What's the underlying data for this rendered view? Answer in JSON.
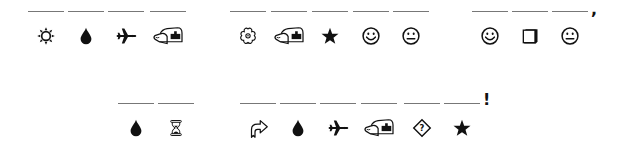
{
  "puzzle": {
    "row1": {
      "groups": [
        {
          "slots": [
            {
              "icon": "sun-icon",
              "glyph": "☼"
            },
            {
              "icon": "droplet-icon",
              "glyph": "💧"
            },
            {
              "icon": "airplane-icon",
              "glyph": "✈"
            },
            {
              "icon": "mailbox-icon",
              "glyph": "📫"
            }
          ],
          "trailing": ""
        },
        {
          "slots": [
            {
              "icon": "flower-icon",
              "glyph": "✿"
            },
            {
              "icon": "mailbox-icon",
              "glyph": "📫"
            },
            {
              "icon": "star-icon",
              "glyph": "★"
            },
            {
              "icon": "smiley-icon",
              "glyph": "☺"
            },
            {
              "icon": "neutral-face-icon",
              "glyph": "😐"
            }
          ],
          "trailing": ""
        },
        {
          "slots": [
            {
              "icon": "smiley-icon",
              "glyph": "☺"
            },
            {
              "icon": "shadowed-square-icon",
              "glyph": "❒"
            },
            {
              "icon": "neutral-face-icon",
              "glyph": "😐"
            }
          ],
          "trailing": ","
        }
      ]
    },
    "row2": {
      "groups": [
        {
          "slots": [
            {
              "icon": "droplet-icon",
              "glyph": "💧"
            },
            {
              "icon": "hourglass-icon",
              "glyph": "⌛"
            }
          ],
          "trailing": ""
        },
        {
          "slots": [
            {
              "icon": "share-arrow-icon",
              "glyph": "⮫"
            },
            {
              "icon": "droplet-icon",
              "glyph": "💧"
            },
            {
              "icon": "airplane-icon",
              "glyph": "✈"
            },
            {
              "icon": "mailbox-icon",
              "glyph": "📫"
            },
            {
              "icon": "question-diamond-icon",
              "glyph": "⍰"
            },
            {
              "icon": "star-icon",
              "glyph": "★"
            }
          ],
          "trailing": "!"
        }
      ]
    }
  }
}
